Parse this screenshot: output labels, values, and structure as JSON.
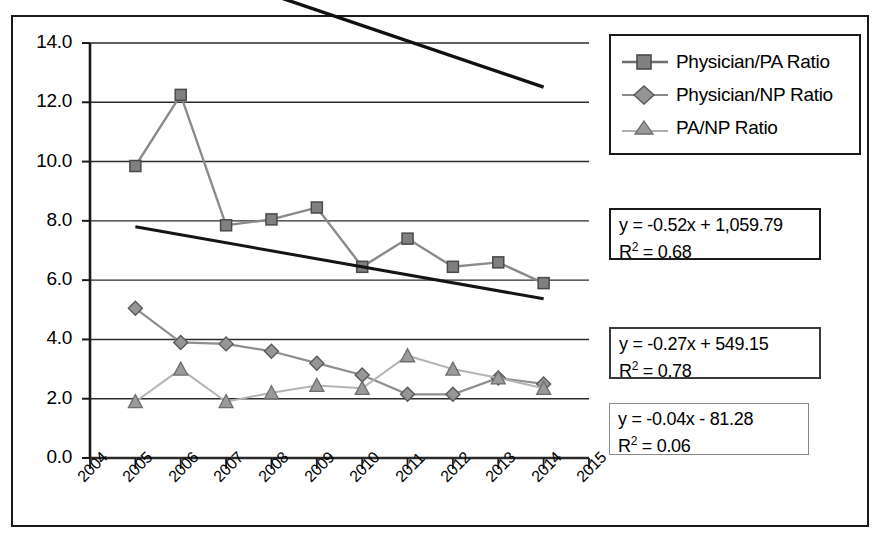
{
  "chart_data": {
    "type": "line",
    "title": "",
    "xlabel": "",
    "ylabel": "",
    "x": [
      2005,
      2006,
      2007,
      2008,
      2009,
      2010,
      2011,
      2012,
      2013,
      2014
    ],
    "xlim": [
      2004,
      2015
    ],
    "ylim": [
      0.0,
      14.0
    ],
    "ytick_step": 2.0,
    "grid": "horizontal",
    "legend_position": "top-right",
    "series": [
      {
        "name": "Physician/PA Ratio",
        "marker": "square",
        "color": "#808080",
        "values": [
          9.85,
          12.25,
          7.85,
          8.05,
          8.45,
          6.45,
          7.4,
          6.45,
          6.6,
          5.9
        ],
        "trendline": {
          "equation": "y = -0.52x + 1,059.79",
          "r_squared": "R2 = 0.68",
          "slope": -0.52,
          "intercept": 1059.79,
          "r2": 0.68
        }
      },
      {
        "name": "Physician/NP Ratio",
        "marker": "diamond",
        "color": "#8c8c8c",
        "values": [
          5.05,
          3.9,
          3.85,
          3.6,
          3.2,
          2.8,
          2.15,
          2.15,
          2.7,
          2.5
        ],
        "trendline": {
          "equation": "y = -0.27x + 549.15",
          "r_squared": "R2 = 0.78",
          "slope": -0.27,
          "intercept": 549.15,
          "r2": 0.78
        }
      },
      {
        "name": "PA/NP Ratio",
        "marker": "triangle",
        "color": "#999999",
        "values": [
          1.9,
          3.0,
          1.9,
          2.2,
          2.45,
          2.35,
          3.45,
          3.0,
          2.7,
          2.35
        ],
        "trendline": {
          "equation": "y = -0.04x - 81.28",
          "r_squared": "R2 = 0.06",
          "slope": -0.04,
          "intercept": -81.28,
          "r2": 0.06
        }
      }
    ],
    "ytick_labels": [
      "14.0",
      "12.0",
      "10.0",
      "8.0",
      "6.0",
      "4.0",
      "2.0",
      "0.0"
    ],
    "xtick_labels": [
      "2004",
      "2005",
      "2006",
      "2007",
      "2008",
      "2009",
      "2010",
      "2011",
      "2012",
      "2013",
      "2014",
      "2015"
    ]
  },
  "legend": {
    "items": [
      {
        "label": "Physician/PA Ratio",
        "marker": "square"
      },
      {
        "label": "Physician/NP Ratio",
        "marker": "diamond"
      },
      {
        "label": "PA/NP Ratio",
        "marker": "triangle"
      }
    ]
  },
  "equation_boxes": [
    {
      "equation": "y = -0.52x + 1,059.79",
      "r_label": "R",
      "r_exp": "2",
      "r_value": " = 0.68"
    },
    {
      "equation": "y = -0.27x + 549.15",
      "r_label": "R",
      "r_exp": "2",
      "r_value": " = 0.78"
    },
    {
      "equation": "y = -0.04x - 81.28",
      "r_label": "R",
      "r_exp": "2",
      "r_value": " = 0.06"
    }
  ],
  "colors": {
    "axis": "#1a1a1a",
    "grid": "#2b2b2b",
    "series_gray": "#808080",
    "trend_dark": "#111111",
    "trend_light": "#1a1a1a",
    "background": "#ffffff"
  }
}
